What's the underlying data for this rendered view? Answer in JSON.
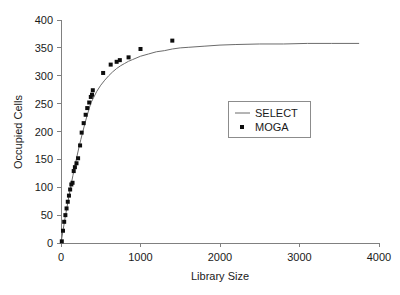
{
  "chart_data": {
    "type": "scatter",
    "title": "",
    "xlabel": "Library Size",
    "ylabel": "Occupied Cells",
    "xlim": [
      0,
      4000
    ],
    "ylim": [
      0,
      400
    ],
    "xticks": [
      0,
      1000,
      2000,
      3000,
      4000
    ],
    "yticks": [
      0,
      50,
      100,
      150,
      200,
      250,
      300,
      350,
      400
    ],
    "grid": false,
    "legend_position": "center-right",
    "series": [
      {
        "name": "SELECT",
        "style": "line",
        "color": "#6b6b6b",
        "x": [
          0,
          25,
          50,
          75,
          100,
          125,
          150,
          175,
          200,
          225,
          250,
          275,
          300,
          325,
          350,
          375,
          400,
          450,
          500,
          550,
          600,
          650,
          700,
          750,
          800,
          850,
          900,
          1000,
          1100,
          1200,
          1300,
          1400,
          1500,
          1600,
          1800,
          2000,
          2200,
          2500,
          2800,
          3100,
          3400,
          3750
        ],
        "y": [
          0,
          22,
          44,
          64,
          84,
          103,
          121,
          138,
          155,
          171,
          186,
          200,
          214,
          227,
          239,
          251,
          258,
          272,
          283,
          292,
          300,
          307,
          313,
          318,
          322,
          326,
          329,
          335,
          339,
          343,
          345,
          348,
          350,
          351,
          353,
          355,
          356,
          357,
          357,
          358,
          358,
          358
        ]
      },
      {
        "name": "MOGA",
        "style": "markers",
        "color": "#0d0d0d",
        "x": [
          10,
          25,
          40,
          55,
          70,
          85,
          100,
          115,
          130,
          145,
          160,
          175,
          195,
          215,
          240,
          260,
          285,
          310,
          330,
          355,
          375,
          390,
          400,
          530,
          625,
          700,
          740,
          850,
          1000,
          1400
        ],
        "y": [
          3,
          22,
          38,
          50,
          62,
          74,
          85,
          96,
          105,
          108,
          129,
          136,
          143,
          152,
          175,
          198,
          215,
          230,
          242,
          252,
          262,
          266,
          274,
          305,
          320,
          325,
          328,
          333,
          348,
          363
        ]
      }
    ]
  },
  "legend": {
    "entries": [
      {
        "label": "SELECT",
        "marker": "line"
      },
      {
        "label": "MOGA",
        "marker": "square"
      }
    ]
  },
  "axes": {
    "x_label": "Library Size",
    "y_label": "Occupied Cells",
    "x_tick_labels": [
      "0",
      "1000",
      "2000",
      "3000",
      "4000"
    ],
    "y_tick_labels": [
      "0",
      "50",
      "100",
      "150",
      "200",
      "250",
      "300",
      "350",
      "400"
    ]
  },
  "colors": {
    "line": "#6b6b6b",
    "marker": "#0d0d0d",
    "axis": "#808080",
    "text": "#1a1a1a",
    "background": "#ffffff"
  }
}
